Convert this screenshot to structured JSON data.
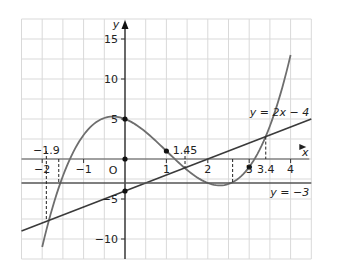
{
  "chart_data": {
    "type": "line",
    "title": "",
    "xlabel": "x",
    "ylabel": "y",
    "xlim": [
      -2.5,
      4.5
    ],
    "ylim": [
      -12.5,
      17.5
    ],
    "grid": true,
    "origin_label": "O",
    "x_ticks": [
      -2,
      -1,
      1,
      2,
      3,
      4
    ],
    "y_ticks": [
      -10,
      -5,
      5,
      10,
      15
    ],
    "series": [
      {
        "name": "y = x^3 - 3x^2 - 2x + 5",
        "kind": "cubic",
        "coeffs": [
          1,
          -3,
          -2,
          5
        ],
        "x_range": [
          -2,
          4
        ],
        "color": "#6e6e6e"
      },
      {
        "name": "y = 2x - 4",
        "label": "y = 2x − 4",
        "kind": "line",
        "slope": 2,
        "intercept": -4,
        "x_range": [
          -2.5,
          4.5
        ],
        "color": "#3a3a3a"
      },
      {
        "name": "y = -3",
        "label": "y = −3",
        "kind": "hline",
        "y": -3,
        "x_range": [
          -2.5,
          4.5
        ],
        "color": "#555555"
      }
    ],
    "points": [
      {
        "x": 0,
        "y": 5
      },
      {
        "x": 0,
        "y": 0
      },
      {
        "x": 0,
        "y": -4
      },
      {
        "x": 1,
        "y": 1
      },
      {
        "x": 3,
        "y": -1
      }
    ],
    "annotations": [
      {
        "text": "−1.9",
        "x": -1.9,
        "dashed_from_y": 1.0,
        "dashed_to_y": -7.8
      },
      {
        "text": "1.45",
        "x": 1.45,
        "dashed_from_y": 1.0,
        "dashed_to_y": -1.1
      },
      {
        "text": "3.4",
        "x": 3.4,
        "dashed_from_y": 2.8,
        "dashed_to_y": 0
      }
    ],
    "extra_dashed": [
      {
        "x": -1.6,
        "from_y": 0,
        "to_y": -3
      },
      {
        "x": 2.6,
        "from_y": 0,
        "to_y": -3
      }
    ]
  }
}
